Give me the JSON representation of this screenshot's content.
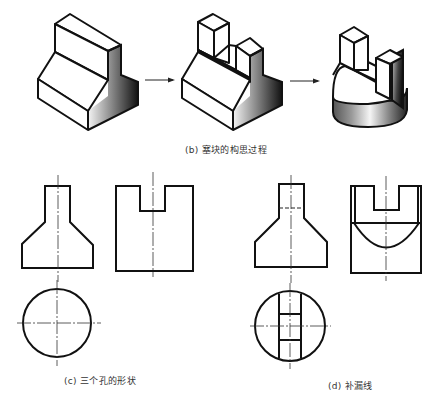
{
  "figure": {
    "captions": {
      "b": "(b) 塞块的构思过程",
      "c": "(c) 三个孔的形状",
      "d": "(d) 补漏线"
    },
    "panels": [
      {
        "id": "b",
        "description": "Three isometric stages connected by arrows",
        "stages": 3
      },
      {
        "id": "c",
        "description": "Front view, side view, and top view (circle)"
      },
      {
        "id": "d",
        "description": "Completed views with added missing lines (hidden line, arc, slot rungs)"
      }
    ],
    "colors": {
      "line": "#111111",
      "shade_dark": "#1a1a1a",
      "shade_light": "#f4f4f4",
      "background": "#ffffff",
      "caption": "#333333"
    }
  }
}
